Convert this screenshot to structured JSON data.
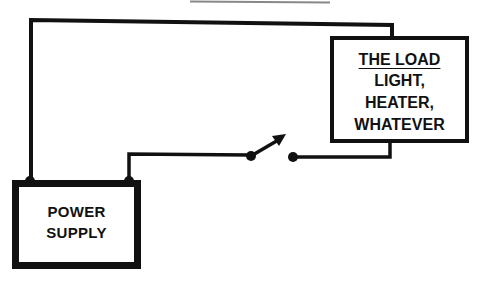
{
  "diagram": {
    "type": "circuit",
    "colors": {
      "wire": "#111111",
      "background": "#ffffff",
      "top_rule": "#888888"
    },
    "load": {
      "title": "THE LOAD",
      "lines": [
        "LIGHT,",
        "HEATER,",
        "WHATEVER"
      ]
    },
    "power_supply": {
      "lines": [
        "POWER",
        "SUPPLY"
      ]
    },
    "switch": {
      "state": "open"
    },
    "connections": [
      {
        "from": "power_supply.terminal_left",
        "to": "load.top"
      },
      {
        "from": "power_supply.terminal_right",
        "to": "switch.left"
      },
      {
        "from": "switch.right",
        "to": "load.bottom"
      }
    ]
  }
}
